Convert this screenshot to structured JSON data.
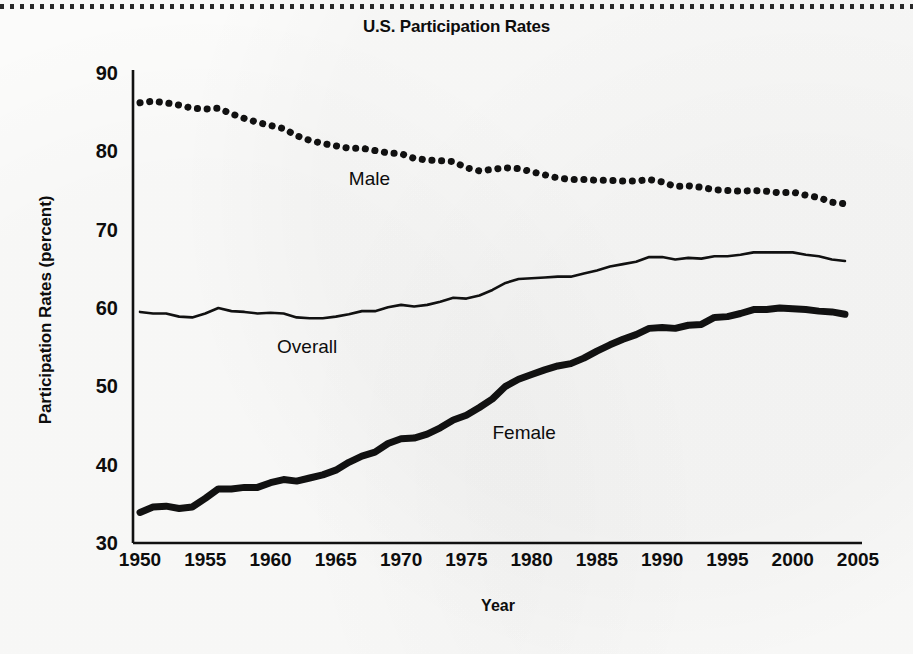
{
  "figure": {
    "title": "U.S. Participation Rates",
    "top_rule": "dotted-rule"
  },
  "chart_data": {
    "type": "line",
    "title": "U.S. Participation Rates",
    "xlabel": "Year",
    "ylabel": "Participation Rates (percent)",
    "xlim": [
      1950,
      2005
    ],
    "ylim": [
      30,
      90
    ],
    "xticks": [
      "1950",
      "1955",
      "1960",
      "1965",
      "1970",
      "1975",
      "1980",
      "1985",
      "1990",
      "1995",
      "2000",
      "2005"
    ],
    "yticks": [
      "30",
      "40",
      "50",
      "60",
      "70",
      "80",
      "90"
    ],
    "grid": false,
    "legend": "inline-annotations",
    "x": [
      1950,
      1951,
      1952,
      1953,
      1954,
      1955,
      1956,
      1957,
      1958,
      1959,
      1960,
      1961,
      1962,
      1963,
      1964,
      1965,
      1966,
      1967,
      1968,
      1969,
      1970,
      1971,
      1972,
      1973,
      1974,
      1975,
      1976,
      1977,
      1978,
      1979,
      1980,
      1981,
      1982,
      1983,
      1984,
      1985,
      1986,
      1987,
      1988,
      1989,
      1990,
      1991,
      1992,
      1993,
      1994,
      1995,
      1996,
      1997,
      1998,
      1999,
      2000,
      2001,
      2002,
      2003,
      2004
    ],
    "series": [
      {
        "name": "Male",
        "style": "dotted",
        "color": "#111111",
        "label_x": 1966,
        "label_y": 76.5,
        "values": [
          86.2,
          86.4,
          86.2,
          85.9,
          85.5,
          85.4,
          85.5,
          84.8,
          84.2,
          83.7,
          83.3,
          82.9,
          82.0,
          81.4,
          81.0,
          80.7,
          80.4,
          80.4,
          80.1,
          79.8,
          79.7,
          79.1,
          78.9,
          78.8,
          78.7,
          77.9,
          77.5,
          77.7,
          77.9,
          77.8,
          77.4,
          77.0,
          76.6,
          76.4,
          76.4,
          76.3,
          76.3,
          76.2,
          76.2,
          76.4,
          76.1,
          75.5,
          75.6,
          75.4,
          75.1,
          75.0,
          74.9,
          75.0,
          74.9,
          74.7,
          74.8,
          74.4,
          74.1,
          73.5,
          73.3
        ]
      },
      {
        "name": "Overall",
        "style": "solid-thin",
        "color": "#111111",
        "label_x": 1960.5,
        "label_y": 55.0,
        "values": [
          59.5,
          59.3,
          59.3,
          58.9,
          58.8,
          59.3,
          60.0,
          59.6,
          59.5,
          59.3,
          59.4,
          59.3,
          58.8,
          58.7,
          58.7,
          58.9,
          59.2,
          59.6,
          59.6,
          60.1,
          60.4,
          60.2,
          60.4,
          60.8,
          61.3,
          61.2,
          61.6,
          62.3,
          63.2,
          63.7,
          63.8,
          63.9,
          64.0,
          64.0,
          64.4,
          64.8,
          65.3,
          65.6,
          65.9,
          66.5,
          66.5,
          66.2,
          66.4,
          66.3,
          66.6,
          66.6,
          66.8,
          67.1,
          67.1,
          67.1,
          67.1,
          66.8,
          66.6,
          66.2,
          66.0
        ]
      },
      {
        "name": "Female",
        "style": "solid-thick",
        "color": "#111111",
        "label_x": 1977,
        "label_y": 44.0,
        "values": [
          33.9,
          34.6,
          34.7,
          34.4,
          34.6,
          35.7,
          36.9,
          36.9,
          37.1,
          37.1,
          37.7,
          38.1,
          37.9,
          38.3,
          38.7,
          39.3,
          40.3,
          41.1,
          41.6,
          42.7,
          43.3,
          43.4,
          43.9,
          44.7,
          45.7,
          46.3,
          47.3,
          48.4,
          50.0,
          50.9,
          51.5,
          52.1,
          52.6,
          52.9,
          53.6,
          54.5,
          55.3,
          56.0,
          56.6,
          57.4,
          57.5,
          57.4,
          57.8,
          57.9,
          58.8,
          58.9,
          59.3,
          59.8,
          59.8,
          60.0,
          59.9,
          59.8,
          59.6,
          59.5,
          59.2
        ]
      }
    ]
  },
  "axis": {
    "x_title": "Year",
    "y_title": "Participation Rates (percent)"
  }
}
